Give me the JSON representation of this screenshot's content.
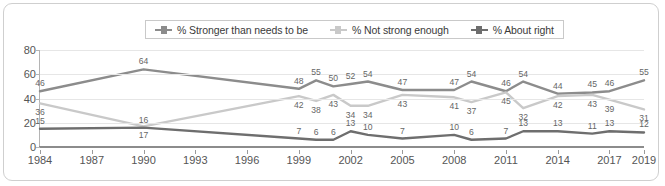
{
  "legend": {
    "position": "top-center",
    "items": [
      {
        "label": "% Stronger than needs to be",
        "color": "#8c8c8c",
        "icon": "line-marker-icon"
      },
      {
        "label": "% Not strong enough",
        "color": "#c9c9c9",
        "icon": "line-marker-icon"
      },
      {
        "label": "% About right",
        "color": "#6e6e6e",
        "icon": "line-marker-icon"
      }
    ]
  },
  "chart_data": {
    "type": "line",
    "title": "",
    "subtitle": "",
    "xlabel": "",
    "ylabel": "",
    "ylim": [
      0,
      80
    ],
    "yticks": [
      0,
      20,
      40,
      60,
      80
    ],
    "grid": true,
    "legend_position": "top-center",
    "x": [
      1984,
      1990,
      1999,
      2000,
      2001,
      2002,
      2003,
      2005,
      2008,
      2009,
      2011,
      2012,
      2014,
      2016,
      2017,
      2019
    ],
    "xticks": [
      1984,
      1987,
      1990,
      1993,
      1996,
      1999,
      2002,
      2005,
      2008,
      2011,
      2014,
      2017,
      2019
    ],
    "series": [
      {
        "name": "% Stronger than needs to be",
        "color": "#8c8c8c",
        "values": [
          46,
          64,
          48,
          55,
          50,
          52,
          54,
          47,
          47,
          54,
          46,
          54,
          44,
          45,
          46,
          55
        ]
      },
      {
        "name": "% Not strong enough",
        "color": "#c9c9c9",
        "values": [
          36,
          17,
          42,
          38,
          43,
          34,
          34,
          43,
          41,
          37,
          45,
          32,
          42,
          43,
          39,
          31
        ]
      },
      {
        "name": "% About right",
        "color": "#6e6e6e",
        "values": [
          15,
          16,
          7,
          6,
          6,
          13,
          10,
          7,
          10,
          6,
          7,
          13,
          13,
          11,
          13,
          12
        ]
      }
    ]
  }
}
